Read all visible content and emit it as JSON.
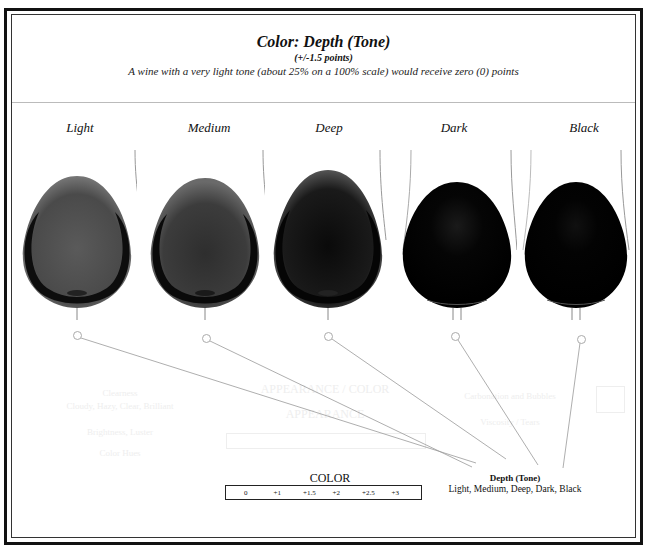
{
  "header": {
    "title": "Color: Depth (Tone)",
    "subtitle": "(+/-1.5 points)",
    "description": "A wine with a very light tone (about 25% on a 100% scale) would receive zero (0) points"
  },
  "glasses": [
    {
      "label": "Light",
      "tone": "#4a4a4a",
      "rim": "#111111"
    },
    {
      "label": "Medium",
      "tone": "#3a3a3a",
      "rim": "#0d0d0d"
    },
    {
      "label": "Deep",
      "tone": "#1e1e1e",
      "rim": "#080808"
    },
    {
      "label": "Dark",
      "tone": "#050505",
      "rim": "#000000"
    },
    {
      "label": "Black",
      "tone": "#020202",
      "rim": "#000000"
    }
  ],
  "callout": {
    "title": "Depth (Tone)",
    "options": "Light, Medium, Deep, Dark, Black"
  },
  "scale": {
    "title": "COLOR",
    "values": [
      "0",
      "+1",
      "+1.5",
      "+2",
      "+2.5",
      "+3"
    ]
  },
  "faded_background": {
    "left": [
      "Clearness",
      "Cloudy, Hazy, Clear, Brilliant",
      "Brightness, Luster",
      "Color Hues"
    ],
    "center": [
      "APPEARANCE / COLOR",
      "APPEARANCE"
    ],
    "right": [
      "Carbonation and Bubbles",
      "Viscosity / Tears"
    ]
  }
}
